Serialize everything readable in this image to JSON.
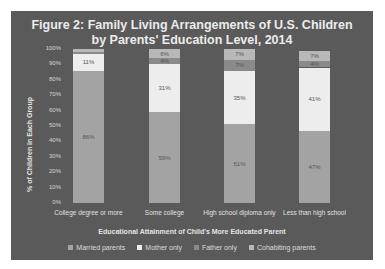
{
  "chart_data": {
    "type": "bar",
    "stacked": true,
    "title": "Figure 2: Family Living Arrangements of U.S. Children by Parents' Education Level, 2014",
    "title_lines": [
      "Figure 2: Family Living Arrangements of U.S. Children",
      "by Parents' Education Level, 2014"
    ],
    "xlabel": "Educational Attainment of Child's More Educated Parent",
    "ylabel": "% of Children in Each Group",
    "ylim": [
      0,
      100
    ],
    "yticks": [
      "100%",
      "90%",
      "80%",
      "70%",
      "60%",
      "50%",
      "40%",
      "30%",
      "20%",
      "10%",
      "0%"
    ],
    "categories": [
      "College degree or more",
      "Some college",
      "High school diploma only",
      "Less than high school"
    ],
    "series": [
      {
        "name": "Married parents",
        "color": "#a3a3a3",
        "values": [
          86,
          59,
          51,
          47
        ],
        "labels": [
          "86%",
          "59%",
          "51%",
          "47%"
        ]
      },
      {
        "name": "Mother only",
        "color": "#ededed",
        "values": [
          11,
          31,
          35,
          41
        ],
        "labels": [
          "11%",
          "31%",
          "35%",
          "41%"
        ]
      },
      {
        "name": "Father only",
        "color": "#8a8a8a",
        "values": [
          1,
          4,
          7,
          4
        ],
        "labels": [
          "1%",
          "4%",
          "7%",
          "4%"
        ]
      },
      {
        "name": "Cohabiting parents",
        "color": "#b8b8b8",
        "values": [
          2,
          6,
          7,
          7
        ],
        "labels": [
          "2%",
          "6%",
          "7%",
          "7%"
        ]
      }
    ],
    "legend_position": "bottom",
    "grid": false
  }
}
